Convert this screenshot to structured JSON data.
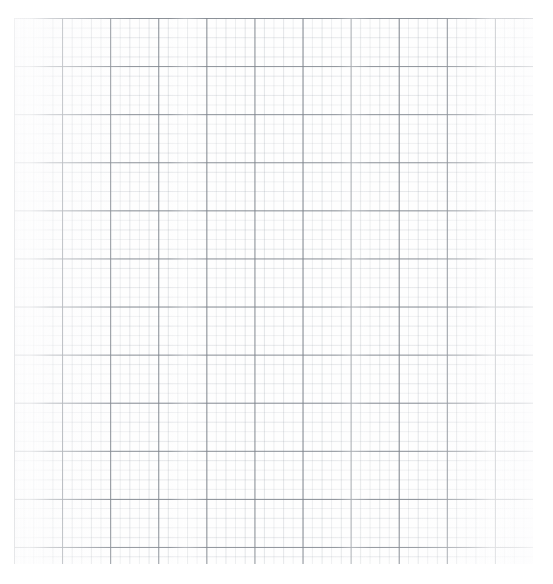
{
  "document": {
    "kind": "scanned-graph-paper",
    "title": "",
    "visible_text": "",
    "background_color": "#ffffff",
    "paper_color": "#fefefe"
  },
  "grid": {
    "major_line_color": "#7e848c",
    "minor_line_color": "#969ea8",
    "major_cell_px": 48.1,
    "minor_cell_px": 9.62,
    "minor_per_major": 5,
    "origin_x_px": 14,
    "origin_y_px": 18,
    "width_px": 519,
    "height_px": 546,
    "major_columns": 11,
    "major_rows": 12,
    "grid_visible": true
  },
  "artifacts": {
    "top_rule_color": "#e8e9ea",
    "top_rule_label": "scan-edge-rule",
    "smudge_label": "scan-smudge"
  },
  "chart_data": {
    "type": "table",
    "title": "",
    "xlabel": "",
    "ylabel": "",
    "categories": [],
    "values": [],
    "series": [],
    "grid": true,
    "legend": null,
    "annotations": [],
    "note": "Blank graph paper: no plotted data, no tick labels, no legend."
  }
}
